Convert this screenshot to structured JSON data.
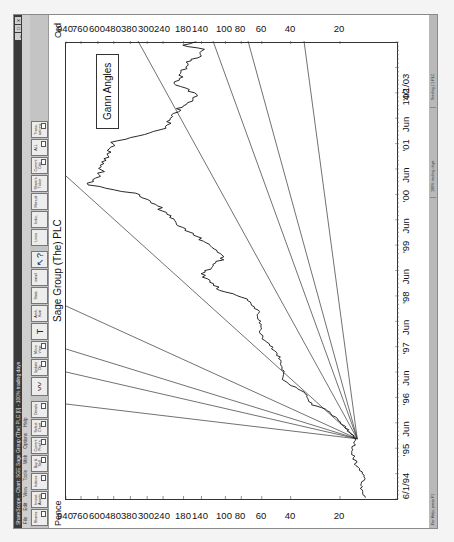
{
  "window": {
    "title": "ShareScope - Chart: SGE Sage Group (The) PLC [0] - 100% trading days",
    "controls": [
      "_",
      "□",
      "x"
    ]
  },
  "menu": [
    "File",
    "Edit",
    "View",
    "Tools",
    "Web",
    "Options",
    "Help"
  ],
  "toolbar": [
    {
      "label": "Shares",
      "icon": null
    },
    {
      "label": "Invest. Assets",
      "icon": null
    },
    {
      "label": "Indices",
      "icon": null
    },
    {
      "label": "Buy & Sell",
      "icon": null
    },
    {
      "label": "Current Posit'n",
      "icon": null
    },
    {
      "label": "Select Chart",
      "icon": null
    },
    {
      "label": "Details",
      "icon": null
    },
    {
      "label": "",
      "icon": "chart-line-icon"
    },
    {
      "label": "Update Dly",
      "icon": null
    },
    {
      "label": "Move View",
      "icon": null
    },
    {
      "label": "",
      "icon": "text-tool-icon"
    },
    {
      "label": "Arch. Hum",
      "icon": null
    },
    {
      "label": "Stats",
      "icon": null
    },
    {
      "label": "email",
      "icon": null
    },
    {
      "label": "",
      "icon": "help-cursor-icon"
    },
    {
      "label": "Lines",
      "icon": null
    },
    {
      "label": "Indic.",
      "icon": null
    },
    {
      "label": "Manual",
      "icon": null
    },
    {
      "label": "Share's Ticker",
      "icon": null
    },
    {
      "label": "Current Calc",
      "icon": null
    },
    {
      "label": "ALL",
      "icon": null
    },
    {
      "label": "Trans-actions",
      "icon": null
    }
  ],
  "chart": {
    "title": "Sage Group (The) PLC",
    "left_axis_label": "Pence",
    "right_axis_label": "Ord",
    "annotation": "Gann Angles",
    "start_date": "6/1/94",
    "end_date": "14/1/03",
    "x_ticks": [
      "6/1/94",
      "'95",
      "Jun",
      "'96",
      "Jun",
      "'97",
      "Jun",
      "'98",
      "Jun",
      "'99",
      "Jun",
      "'00",
      "Jun",
      "'01",
      "Jun",
      "'02",
      "14/1/03"
    ],
    "y_ticks": [
      "940",
      "760",
      "600",
      "480",
      "380",
      "300",
      "240",
      "180",
      "140",
      "100",
      "80",
      "60",
      "40",
      "20"
    ]
  },
  "statusbar": {
    "help": "For Help, press F1",
    "mode": "100% trading days",
    "info": "Sterling | 1 PLC"
  },
  "chart_data": {
    "type": "line",
    "title": "Sage Group (The) PLC",
    "xlabel": "",
    "ylabel": "Pence",
    "y_scale": "log",
    "ylim": [
      8.7,
      940
    ],
    "xlim": [
      "1994-01-06",
      "2003-01-14"
    ],
    "y_ticks": [
      940,
      760,
      600,
      480,
      380,
      300,
      240,
      180,
      140,
      100,
      80,
      60,
      40,
      20
    ],
    "x_ticks": [
      "6/1/94",
      "'95",
      "Jun",
      "'96",
      "Jun",
      "'97",
      "Jun",
      "'98",
      "Jun",
      "'99",
      "Jun",
      "'00",
      "Jun",
      "'01",
      "Jun",
      "'02",
      "14/1/03"
    ],
    "legend": [],
    "annotations": [
      "Gann Angles"
    ],
    "series": [
      {
        "name": "Sage Group (The) PLC price",
        "x": [
          "1994-01",
          "1994-04",
          "1994-06",
          "1994-09",
          "1994-12",
          "1995-03",
          "1995-07",
          "1995-10",
          "1995-11",
          "1996-02",
          "1996-05",
          "1996-07",
          "1996-11",
          "1997-03",
          "1997-09",
          "1997-12",
          "1998-02",
          "1998-04",
          "1998-06",
          "1998-10",
          "1999-02",
          "1999-05",
          "1999-10",
          "2000-01",
          "2000-03",
          "2000-05",
          "2000-08",
          "2001-01",
          "2001-04",
          "2001-09",
          "2001-10",
          "2001-12",
          "2002-03",
          "2002-08",
          "2002-09",
          "2002-11",
          "2002-12",
          "2003-01"
        ],
        "values": [
          14,
          15,
          14,
          16,
          17,
          16,
          20,
          24,
          30,
          33,
          46,
          44,
          48,
          60,
          63,
          73,
          105,
          120,
          140,
          100,
          140,
          190,
          260,
          360,
          700,
          580,
          560,
          480,
          240,
          190,
          170,
          150,
          200,
          170,
          150,
          135,
          180,
          150
        ]
      },
      {
        "name": "Gann angle lines",
        "origin": {
          "date": "1995-03",
          "price": 15.7
        },
        "count": 9
      }
    ]
  }
}
